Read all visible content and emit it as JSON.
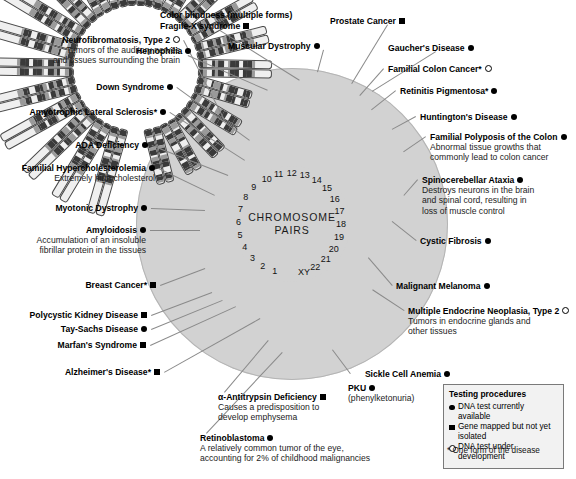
{
  "center": {
    "line1": "CHROMOSOME",
    "line2": "PAIRS"
  },
  "chromosome_numbers": [
    "1",
    "2",
    "3",
    "4",
    "5",
    "6",
    "7",
    "8",
    "9",
    "10",
    "11",
    "12",
    "13",
    "14",
    "15",
    "16",
    "17",
    "18",
    "19",
    "20",
    "21",
    "22",
    "XY"
  ],
  "colors": {
    "circle_fill": "#d2d2d2",
    "leader_line": "#8a8a8a",
    "chromosome_band": "#3a3a3a",
    "legend_bg": "#f2f2f2"
  },
  "legend": {
    "title": "Testing procedures",
    "items": [
      {
        "symbol": "dot",
        "text": "DNA test currently available"
      },
      {
        "symbol": "sq",
        "text": "Gene mapped but not yet isolated"
      },
      {
        "symbol": "open",
        "text": "DNA test under development"
      }
    ],
    "footnote": "* One form of the disease"
  },
  "labels_left": [
    {
      "title": "Neurofibromatosis, Type 2",
      "symbol": "open",
      "desc": [
        "Tumors of the auditory nerves",
        "and tissues surrounding the brain"
      ]
    },
    {
      "title": "Down Syndrome",
      "symbol": "dot",
      "desc": []
    },
    {
      "title": "Amyotrophic Lateral Sclerosis*",
      "symbol": "dot",
      "desc": []
    },
    {
      "title": "ADA Deficiency",
      "symbol": "dot",
      "desc": []
    },
    {
      "title": "Familial Hypercholesterolemia",
      "symbol": "dot",
      "desc": [
        "Extremely high cholesterol"
      ]
    },
    {
      "title": "Myotonic Dystrophy",
      "symbol": "dot",
      "desc": []
    },
    {
      "title": "Amyloidosis",
      "symbol": "dot",
      "desc": [
        "Accumulation of an insoluble",
        "fibrillar protein in the tissues"
      ]
    },
    {
      "title": "Breast Cancer*",
      "symbol": "sq",
      "desc": []
    },
    {
      "title": "Polycystic Kidney Disease",
      "symbol": "sq",
      "desc": []
    },
    {
      "title": "Tay-Sachs Disease",
      "symbol": "dot",
      "desc": []
    },
    {
      "title": "Marfan's Syndrome",
      "symbol": "sq",
      "desc": []
    },
    {
      "title": "Alzheimer's Disease*",
      "symbol": "sq",
      "desc": []
    }
  ],
  "labels_top": [
    {
      "title": "Color blindness (multiple forms)",
      "symbol": "none",
      "desc": []
    },
    {
      "title": "Fragile-X syndrome",
      "symbol": "sq",
      "desc": []
    },
    {
      "title": "Hemophilia",
      "symbol": "dot",
      "desc": []
    },
    {
      "title": "Muscular Dystrophy",
      "symbol": "dot",
      "desc": []
    },
    {
      "title": "Prostate Cancer",
      "symbol": "sq",
      "desc": []
    },
    {
      "title": "Gaucher's Disease",
      "symbol": "dot",
      "desc": []
    }
  ],
  "labels_right": [
    {
      "title": "Familial Colon Cancer*",
      "symbol": "open",
      "desc": []
    },
    {
      "title": "Retinitis Pigmentosa*",
      "symbol": "dot",
      "desc": []
    },
    {
      "title": "Huntington's Disease",
      "symbol": "dot",
      "desc": []
    },
    {
      "title": "Familial Polyposis of the Colon",
      "symbol": "dot",
      "desc": [
        "Abnormal tissue growths that",
        "commonly lead to colon cancer"
      ]
    },
    {
      "title": "Spinocerebellar Ataxia",
      "symbol": "dot",
      "desc": [
        "Destroys neurons in the brain",
        "and spinal cord, resulting in",
        "loss of muscle control"
      ]
    },
    {
      "title": "Cystic Fibrosis",
      "symbol": "dot",
      "desc": []
    },
    {
      "title": "Malignant Melanoma",
      "symbol": "dot",
      "desc": []
    },
    {
      "title": "Multiple Endocrine Neoplasia, Type 2",
      "symbol": "open",
      "desc": [
        "Tumors in endocrine glands and",
        "other tissues"
      ]
    }
  ],
  "labels_bottom": [
    {
      "title": "α-Antitrypsin Deficiency",
      "symbol": "sq",
      "desc": [
        "Causes a predisposition to",
        "develop emphysema"
      ]
    },
    {
      "title": "Retinoblastoma",
      "symbol": "dot",
      "desc": [
        "A relatively common tumor of the eye,",
        "accounting for 2% of childhood malignancies"
      ]
    },
    {
      "title": "PKU",
      "symbol": "dot",
      "desc": [
        "(phenylketonuria)"
      ]
    },
    {
      "title": "Sickle Cell Anemia",
      "symbol": "dot",
      "desc": []
    }
  ]
}
